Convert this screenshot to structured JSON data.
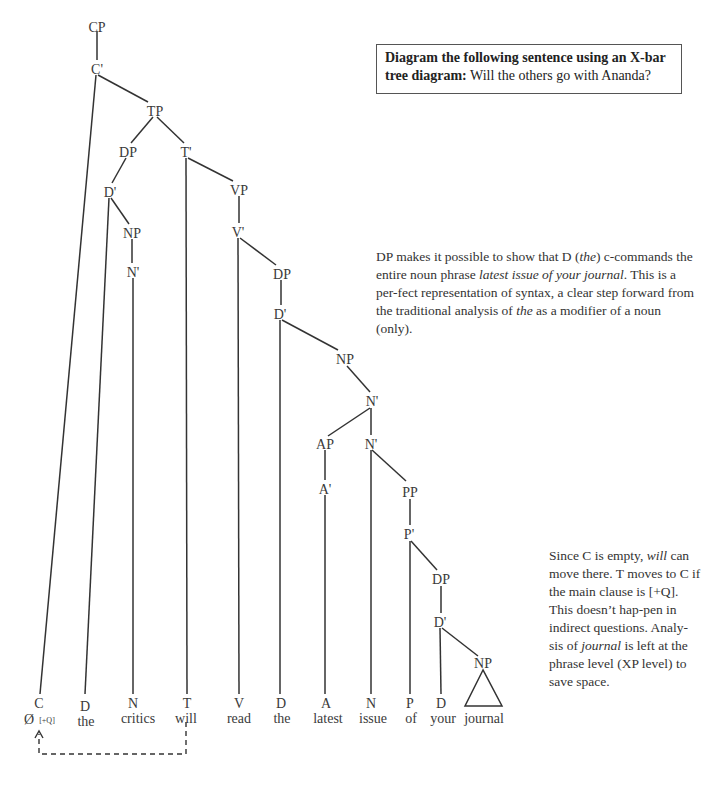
{
  "task": {
    "bold_text": "Diagram the following sentence using an X-bar tree diagram:",
    "sentence": "Will the others go with Ananda?"
  },
  "notes": {
    "dp_note": {
      "part1": "DP makes it possible to show that D (",
      "the1": "the",
      "part2": ") c-commands the entire noun phrase ",
      "phrase": "latest issue of your journal",
      "part3": ". This is a per-fect representation of syntax, a clear step forward from the traditional analysis of ",
      "the2": "the",
      "part4": " as a modifier of a noun (only)."
    },
    "c_note": {
      "part1": "Since C is empty, ",
      "will": "will",
      "part2": " can move there. T moves to C if the main clause is [+Q]. This doesn’t hap-pen in indirect questions. Analy-sis of ",
      "journal": "journal",
      "part3": " is left at the phrase level (XP level) to save space."
    }
  },
  "tree": {
    "nodes": {
      "cp": "CP",
      "c_bar": "C'",
      "tp": "TP",
      "dp1": "DP",
      "t_bar": "T'",
      "d_bar1": "D'",
      "vp": "VP",
      "np1": "NP",
      "v_bar": "V'",
      "n_bar1": "N'",
      "dp2": "DP",
      "d_bar2": "D'",
      "np2": "NP",
      "n_bar2": "N'",
      "ap": "AP",
      "n_bar3": "N'",
      "a_bar": "A'",
      "pp": "PP",
      "p_bar": "P'",
      "dp3": "DP",
      "d_bar3": "D'",
      "np3": "NP"
    },
    "leaves": [
      {
        "cat": "C",
        "word": "Ø",
        "feature": "[+Q]"
      },
      {
        "cat": "D",
        "word": "the"
      },
      {
        "cat": "N",
        "word": "critics"
      },
      {
        "cat": "T",
        "word": "will"
      },
      {
        "cat": "V",
        "word": "read"
      },
      {
        "cat": "D",
        "word": "the"
      },
      {
        "cat": "A",
        "word": "latest"
      },
      {
        "cat": "N",
        "word": "issue"
      },
      {
        "cat": "P",
        "word": "of"
      },
      {
        "cat": "D",
        "word": "your"
      },
      {
        "cat": "",
        "word": "journal"
      }
    ],
    "movement": "T-to-C"
  }
}
